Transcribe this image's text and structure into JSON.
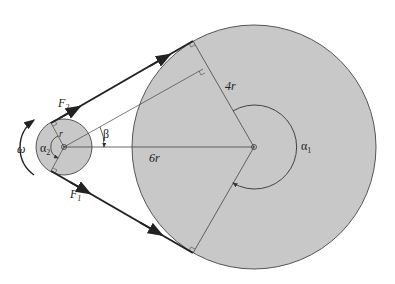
{
  "diagram": {
    "type": "belt-drive",
    "colors": {
      "pulley_fill": "#c8c8c8",
      "pulley_stroke": "#555555",
      "belt": "#222222",
      "line": "#444444",
      "background": "#ffffff"
    },
    "large_pulley": {
      "radius_label": "4r",
      "wrap_angle_label": "α",
      "wrap_angle_sub": "1"
    },
    "small_pulley": {
      "radius_label": "r",
      "wrap_angle_label": "α",
      "wrap_angle_sub": "2"
    },
    "center_distance_label": "6r",
    "angle_label": "β",
    "angular_velocity_label": "ω",
    "tension_tight": {
      "label": "F",
      "sub": "2"
    },
    "tension_slack": {
      "label": "F",
      "sub": "1"
    }
  }
}
